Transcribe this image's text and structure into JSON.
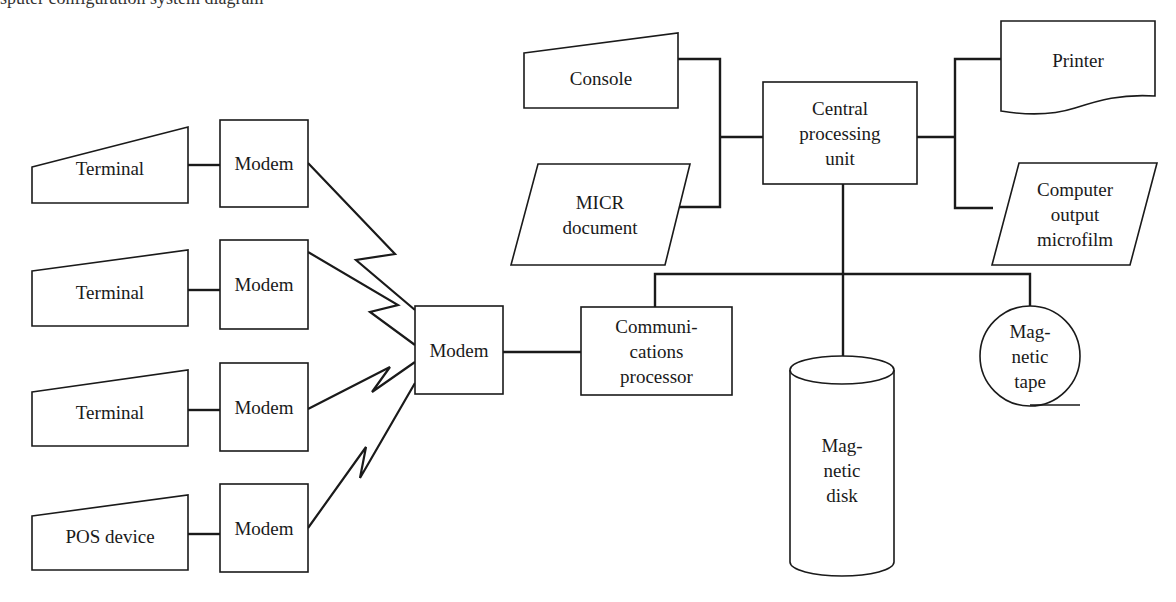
{
  "diagram": {
    "type": "computer-system-configuration",
    "caption_fragment": "sputer configuration system diagram",
    "nodes": {
      "terminal_1": {
        "label": "Terminal",
        "shape": "manual-input"
      },
      "terminal_2": {
        "label": "Terminal",
        "shape": "manual-input"
      },
      "terminal_3": {
        "label": "Terminal",
        "shape": "manual-input"
      },
      "pos_device": {
        "label": "POS device",
        "shape": "manual-input"
      },
      "modem_1": {
        "label": "Modem",
        "shape": "process"
      },
      "modem_2": {
        "label": "Modem",
        "shape": "process"
      },
      "modem_3": {
        "label": "Modem",
        "shape": "process"
      },
      "modem_4": {
        "label": "Modem",
        "shape": "process"
      },
      "modem_central": {
        "label": "Modem",
        "shape": "process"
      },
      "comm_processor": {
        "lines": [
          "Communi-",
          "cations",
          "processor"
        ],
        "shape": "process"
      },
      "console": {
        "label": "Console",
        "shape": "manual-input"
      },
      "micr_document": {
        "lines": [
          "MICR",
          "document"
        ],
        "shape": "input-output"
      },
      "cpu": {
        "lines": [
          "Central",
          "processing",
          "unit"
        ],
        "shape": "process"
      },
      "printer": {
        "label": "Printer",
        "shape": "document"
      },
      "com_microfilm": {
        "lines": [
          "Computer",
          "output",
          "microfilm"
        ],
        "shape": "input-output"
      },
      "magnetic_disk": {
        "lines": [
          "Mag-",
          "netic",
          "disk"
        ],
        "shape": "cylinder"
      },
      "magnetic_tape": {
        "lines": [
          "Mag-",
          "netic",
          "tape"
        ],
        "shape": "circle"
      }
    },
    "edges": [
      {
        "from": "terminal_1",
        "to": "modem_1",
        "style": "line"
      },
      {
        "from": "terminal_2",
        "to": "modem_2",
        "style": "line"
      },
      {
        "from": "terminal_3",
        "to": "modem_3",
        "style": "line"
      },
      {
        "from": "pos_device",
        "to": "modem_4",
        "style": "line"
      },
      {
        "from": "modem_1",
        "to": "modem_central",
        "style": "communication-link"
      },
      {
        "from": "modem_2",
        "to": "modem_central",
        "style": "communication-link"
      },
      {
        "from": "modem_3",
        "to": "modem_central",
        "style": "communication-link"
      },
      {
        "from": "modem_4",
        "to": "modem_central",
        "style": "communication-link"
      },
      {
        "from": "modem_central",
        "to": "comm_processor",
        "style": "line"
      },
      {
        "from": "console",
        "to": "cpu",
        "style": "line"
      },
      {
        "from": "micr_document",
        "to": "cpu",
        "style": "line"
      },
      {
        "from": "cpu",
        "to": "printer",
        "style": "line"
      },
      {
        "from": "cpu",
        "to": "com_microfilm",
        "style": "line"
      },
      {
        "from": "cpu",
        "to": "magnetic_disk",
        "style": "line"
      },
      {
        "from": "cpu",
        "to": "comm_processor",
        "style": "bus"
      },
      {
        "from": "cpu",
        "to": "magnetic_tape",
        "style": "bus"
      }
    ],
    "colors": {
      "stroke": "#1a1a1a",
      "fill": "#ffffff",
      "background": "#ffffff"
    }
  }
}
